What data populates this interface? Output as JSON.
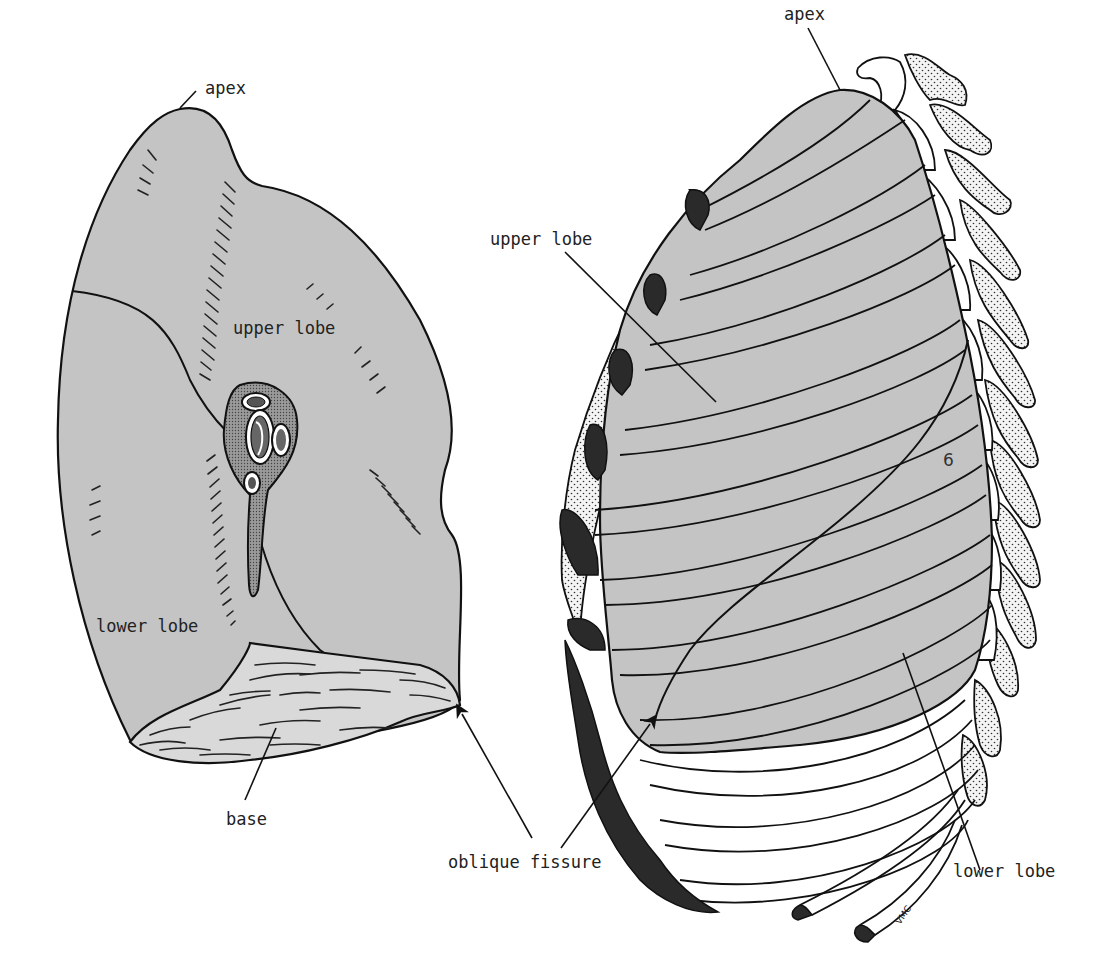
{
  "figure": {
    "type": "anatomical line drawing",
    "colors": {
      "lung_fill": "#c4c4c4",
      "outline": "#111111",
      "cartilage": "#2a2a2a",
      "background": "#ffffff"
    }
  },
  "left_view": {
    "labels": {
      "apex": "apex",
      "upper_lobe": "upper lobe",
      "lower_lobe": "lower lobe",
      "base": "base"
    }
  },
  "right_view": {
    "labels": {
      "apex": "apex",
      "upper_lobe": "upper lobe",
      "lower_lobe": "lower lobe",
      "rib_number": "6",
      "signature": "VMC"
    }
  },
  "shared": {
    "oblique_fissure": "oblique fissure"
  }
}
